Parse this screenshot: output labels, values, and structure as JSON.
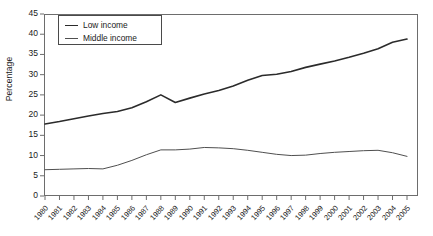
{
  "chart_data": {
    "type": "line",
    "title": "",
    "xlabel": "",
    "ylabel": "Percentage",
    "ylim": [
      0,
      45
    ],
    "ytick_step": 5,
    "yticks": [
      0,
      5,
      10,
      15,
      20,
      25,
      30,
      35,
      40,
      45
    ],
    "grid": false,
    "legend_position": "top-left",
    "categories": [
      "1980",
      "1981",
      "1982",
      "1983",
      "1984",
      "1985",
      "1986",
      "1987",
      "1988",
      "1989",
      "1990",
      "1991",
      "1992",
      "1993",
      "1994",
      "1995",
      "1996",
      "1997",
      "1998",
      "1999",
      "2000",
      "2001",
      "2002",
      "2003",
      "2004",
      "2005"
    ],
    "series": [
      {
        "name": "Low income",
        "color": "#2b2b2b",
        "width": 1.6,
        "values": [
          17.8,
          18.4,
          19.1,
          19.8,
          20.4,
          20.9,
          21.8,
          23.3,
          25.0,
          23.1,
          24.2,
          25.2,
          26.1,
          27.2,
          28.6,
          29.8,
          30.1,
          30.8,
          31.8,
          32.6,
          33.4,
          34.3,
          35.3,
          36.4,
          38.0,
          38.8
        ]
      },
      {
        "name": "Middle income",
        "color": "#4f4f4f",
        "width": 1.0,
        "values": [
          6.5,
          6.6,
          6.7,
          6.8,
          6.7,
          7.6,
          8.8,
          10.2,
          11.4,
          11.4,
          11.6,
          12.0,
          11.9,
          11.7,
          11.3,
          10.8,
          10.3,
          10.0,
          10.1,
          10.5,
          10.8,
          11.0,
          11.2,
          11.3,
          10.7,
          9.8
        ]
      }
    ]
  }
}
